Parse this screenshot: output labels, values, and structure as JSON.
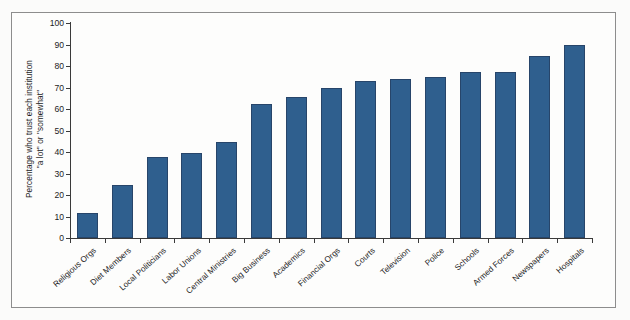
{
  "chart_data": {
    "type": "bar",
    "title": "",
    "subtitle": "",
    "xlabel": "",
    "ylabel": "Percentage who trust each institution \"a lot\" or \"somewhat\"",
    "ylabel_lines": [
      "Percentage who trust each institution",
      "\"a lot\" or \"somewhat\""
    ],
    "ylim": [
      0,
      100
    ],
    "yticks": [
      0,
      10,
      20,
      30,
      40,
      50,
      60,
      70,
      80,
      90,
      100
    ],
    "ytick_labels": [
      "0",
      "10",
      "20",
      "30",
      "40",
      "50",
      "60",
      "70",
      "80",
      "90",
      "100"
    ],
    "grid": false,
    "legend": false,
    "legend_position": "none",
    "bar_color": "#2f5f8e",
    "bar_edge_color": "#27456a",
    "categories": [
      "Religious Orgs",
      "Diet Members",
      "Local Politicians",
      "Labor Unions",
      "Central Ministries",
      "Big Business",
      "Academics",
      "Financial Orgs",
      "Courts",
      "Television",
      "Police",
      "Schools",
      "Armed Forces",
      "Newspapers",
      "Hospitals"
    ],
    "values": [
      11.5,
      24.5,
      37.5,
      39.5,
      44.5,
      62.5,
      65.5,
      70,
      73,
      74,
      75,
      77,
      77,
      84.5,
      90
    ]
  }
}
